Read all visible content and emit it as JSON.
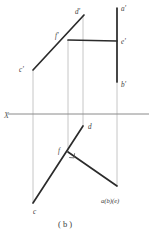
{
  "figure": {
    "caption": "( b )",
    "axis": {
      "name": "X",
      "label": "X",
      "y": 114,
      "x_start": 8,
      "x_end": 149,
      "color": "#8a8a8a"
    },
    "colors": {
      "solid_line": "#2b2b2b",
      "projection_line": "#b0b0b0",
      "axis_line": "#8a8a8a",
      "label_text": "#3b3b3b",
      "background": "#ffffff"
    },
    "points": [
      {
        "id": "d-prime",
        "label": "d'",
        "x": 84,
        "y": 15,
        "lx": 77,
        "ly": 13,
        "view": "frontal"
      },
      {
        "id": "a-prime",
        "label": "a'",
        "x": 117,
        "y": 8,
        "lx": 121,
        "ly": 10,
        "view": "frontal"
      },
      {
        "id": "f-prime",
        "label": "f'",
        "x": 68,
        "y": 40,
        "lx": 57,
        "ly": 37,
        "view": "frontal"
      },
      {
        "id": "e-prime",
        "label": "e'",
        "x": 117,
        "y": 41,
        "lx": 121,
        "ly": 42,
        "view": "frontal"
      },
      {
        "id": "c-prime",
        "label": "c'",
        "x": 33,
        "y": 70,
        "lx": 21,
        "ly": 70,
        "view": "frontal"
      },
      {
        "id": "b-prime",
        "label": "b'",
        "x": 117,
        "y": 82,
        "lx": 121,
        "ly": 85,
        "view": "frontal"
      },
      {
        "id": "d",
        "label": "d",
        "x": 83,
        "y": 126,
        "lx": 88,
        "ly": 127,
        "view": "horizontal"
      },
      {
        "id": "f",
        "label": "f",
        "x": 68,
        "y": 152,
        "lx": 59,
        "ly": 151,
        "view": "horizontal"
      },
      {
        "id": "abe",
        "label": "a(b)(e)",
        "x": 117,
        "y": 186,
        "lx": 102,
        "ly": 200,
        "view": "horizontal"
      },
      {
        "id": "c",
        "label": "c",
        "x": 33,
        "y": 203,
        "lx": 34,
        "ly": 212,
        "view": "horizontal"
      }
    ],
    "solid_segments": [
      {
        "id": "seg-c-prime-d-prime",
        "from": "c-prime",
        "to": "d-prime",
        "desc": "frontal projection line c' to d' through f'"
      },
      {
        "id": "seg-f-prime-e-prime",
        "from": "f-prime",
        "to": "e-prime",
        "desc": "frontal horizontal line f' to e'"
      },
      {
        "id": "seg-a-prime-b-prime",
        "from": "a-prime",
        "to": "b-prime",
        "desc": "frontal vertical line a' to b'"
      },
      {
        "id": "seg-c-d",
        "from": "c",
        "to": "d",
        "desc": "horizontal projection line c to d through f"
      },
      {
        "id": "seg-f-abe",
        "from": "f",
        "to": "abe",
        "desc": "horizontal projection line f to a(b)(e)"
      }
    ],
    "projection_lines": [
      {
        "id": "proj-c",
        "x": 33,
        "y_top": 70,
        "y_bottom": 203
      },
      {
        "id": "proj-f",
        "x": 68,
        "y_top": 40,
        "y_bottom": 152
      },
      {
        "id": "proj-d",
        "x": 83,
        "y_top": 15,
        "y_bottom": 126
      },
      {
        "id": "proj-a",
        "x": 117,
        "y_top": 8,
        "y_bottom": 186
      }
    ],
    "right_angle_marker": {
      "id": "right-angle-at-f",
      "x": 70,
      "y": 154,
      "size": 5
    }
  }
}
